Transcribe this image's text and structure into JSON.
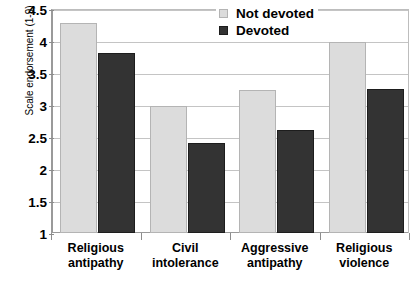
{
  "chart_data": {
    "type": "bar",
    "title": "",
    "xlabel": "",
    "ylabel": "Scale endorsement (1-9)",
    "categories": [
      "Religious antipathy",
      "Civil intolerance",
      "Aggressive antipathy",
      "Religious violence"
    ],
    "category_lines": [
      [
        "Religious",
        "antipathy"
      ],
      [
        "Civil",
        "intolerance"
      ],
      [
        "Aggressive",
        "antipathy"
      ],
      [
        "Religious",
        "violence"
      ]
    ],
    "series": [
      {
        "name": "Not devoted",
        "color": "#dcdcdc",
        "values": [
          4.28,
          2.98,
          3.23,
          3.98
        ]
      },
      {
        "name": "Devoted",
        "color": "#333333",
        "values": [
          3.82,
          2.41,
          2.61,
          3.25
        ]
      }
    ],
    "ylim": [
      1,
      4.5
    ],
    "ytick_values": [
      1,
      1.5,
      2,
      2.5,
      3,
      3.5,
      4,
      4.5
    ],
    "ytick_labels": [
      "1",
      "1.5",
      "2",
      "2.5",
      "3",
      "3.5",
      "4",
      "4.5"
    ],
    "grid": true,
    "legend_position": "top-right",
    "legend_entries": [
      "Not devoted",
      "Devoted"
    ]
  }
}
